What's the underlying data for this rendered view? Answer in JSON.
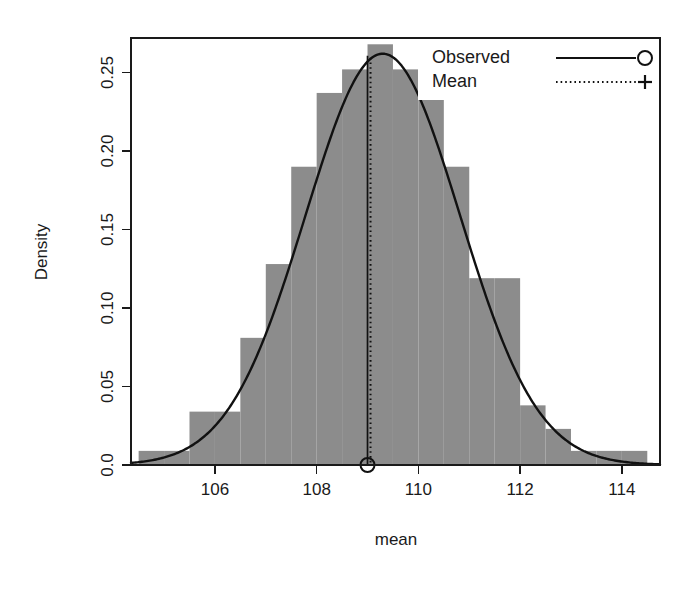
{
  "chart_data": {
    "type": "bar",
    "title": "",
    "subtitle": "",
    "xlabel": "mean",
    "ylabel": "Density",
    "xlim": [
      104.35,
      114.75
    ],
    "ylim": [
      0.0,
      0.272
    ],
    "grid": false,
    "bin_width": 0.5,
    "bin_edges": [
      104.5,
      105.0,
      105.5,
      106.0,
      106.5,
      107.0,
      107.5,
      108.0,
      108.5,
      109.0,
      109.5,
      110.0,
      110.5,
      111.0,
      111.5,
      112.0,
      112.5,
      113.0,
      113.5,
      114.0,
      114.5
    ],
    "categories": [
      "104.5-105.0",
      "105.0-105.5",
      "105.5-106.0",
      "106.0-106.5",
      "106.5-107.0",
      "107.0-107.5",
      "107.5-108.0",
      "108.0-108.5",
      "108.5-109.0",
      "109.0-109.5",
      "109.5-110.0",
      "110.0-110.5",
      "110.5-111.0",
      "111.0-111.5",
      "111.5-112.0",
      "112.0-112.5",
      "112.5-113.0",
      "113.0-113.5",
      "113.5-114.0",
      "114.0-114.5"
    ],
    "values": [
      0.009,
      0.009,
      0.034,
      0.034,
      0.081,
      0.128,
      0.19,
      0.237,
      0.252,
      0.268,
      0.252,
      0.237,
      0.19,
      0.119,
      0.119,
      0.038,
      0.023,
      0.009,
      0.009,
      0.009
    ],
    "bar_color": "#8c8c8c",
    "series": [
      {
        "name": "Observed",
        "type": "line",
        "style": "solid",
        "marker": "circle",
        "color": "#111111",
        "description": "normal density curve overlay",
        "curve_mean": 109.3,
        "curve_sd": 1.52,
        "curve_peak": 0.262
      },
      {
        "name": "Mean",
        "type": "vline",
        "style": "dotted",
        "marker": "plus",
        "color": "#111111",
        "value": 109.0
      }
    ],
    "xticks": [
      106,
      108,
      110,
      112,
      114
    ],
    "xtick_labels": [
      "106",
      "108",
      "110",
      "112",
      "114"
    ],
    "yticks": [
      0.0,
      0.05,
      0.1,
      0.15,
      0.2,
      0.25
    ],
    "ytick_labels": [
      "0.0",
      "0.05",
      "0.10",
      "0.15",
      "0.20",
      "0.25"
    ],
    "legend": {
      "position": "top-right",
      "entries": [
        {
          "label": "Observed",
          "style": "solid",
          "marker": "circle"
        },
        {
          "label": "Mean",
          "style": "dotted",
          "marker": "plus"
        }
      ]
    }
  }
}
